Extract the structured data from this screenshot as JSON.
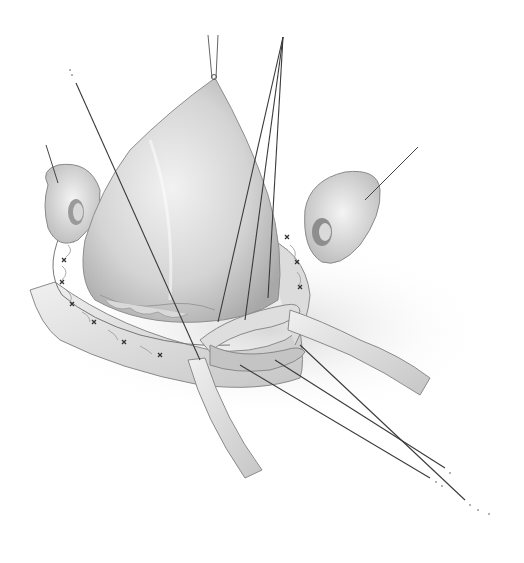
{
  "figure": {
    "palette": {
      "background": "#ffffff",
      "tissue_light": "#e8e8e8",
      "tissue_mid": "#c8c8c8",
      "tissue_shadow": "#9a9a9a",
      "line": "#3a3a3a"
    }
  }
}
